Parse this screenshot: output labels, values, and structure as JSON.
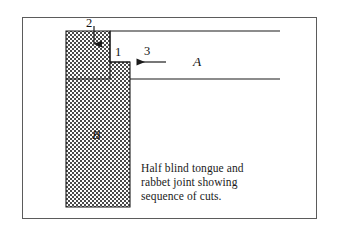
{
  "figure": {
    "type": "technical-line-drawing",
    "subject": "Half blind tongue and rabbet joint showing sequence of cuts.",
    "background_color": "#ffffff",
    "border_color": "#5b5b5b",
    "line_color": "#1b1b1b",
    "fill_pattern": "stipple-dot-checker",
    "fill_color": "#4a4a4a"
  },
  "caption": {
    "line1": "Half blind tongue and",
    "line2": "rabbet joint showing",
    "line3": "sequence of cuts."
  },
  "labels": {
    "cut_1": "1",
    "cut_2": "2",
    "cut_3": "3",
    "board_a": "A",
    "board_b": "B"
  },
  "parts": {
    "board_a_name": "A",
    "board_a_role": "horizontal board with rabbet",
    "board_b_name": "B",
    "board_b_role": "vertical board with tongue"
  },
  "arrows": {
    "arrow_2_direction": "down",
    "arrow_3_direction": "left"
  }
}
